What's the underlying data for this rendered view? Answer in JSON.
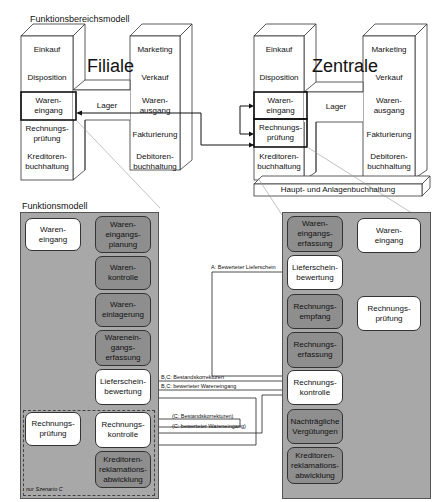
{
  "top_title": "Funktionsbereichsmodell",
  "filiale": {
    "title": "Filiale",
    "left_column": [
      "Einkauf",
      "Disposition",
      "Waren-\neingang",
      "Rechnungs-\nprüfung",
      "Kreditoren-\nbuchhaltung"
    ],
    "middle": "Lager",
    "right_column": [
      "Marketing",
      "Verkauf",
      "Waren-\nausgang",
      "Fakturierung",
      "Debitoren-\nbuchhaltung"
    ],
    "highlighted": [
      "Waren-\neingang"
    ]
  },
  "zentrale": {
    "title": "Zentrale",
    "left_column": [
      "Einkauf",
      "Disposition",
      "Waren-\neingang",
      "Rechnungs-\nprüfung",
      "Kreditoren-\nbuchhaltung"
    ],
    "middle": "Lager",
    "right_column": [
      "Marketing",
      "Verkauf",
      "Waren-\nausgang",
      "Fakturierung",
      "Debitoren-\nbuchhaltung"
    ],
    "base": "Haupt- und Anlagenbuchhaltung",
    "highlighted": [
      "Waren-\neingang",
      "Rechnungs-\nprüfung"
    ]
  },
  "functional_title": "Funktionsmodell",
  "left_panel": {
    "parent_nodes": [
      {
        "label": "Waren-\neingang",
        "style": "white"
      },
      {
        "label": "Rechnungs-\nprüfung",
        "style": "white"
      }
    ],
    "child_nodes": [
      {
        "label": "Waren-\neingangs-\nplanung",
        "style": "grey"
      },
      {
        "label": "Waren-\nkontrolle",
        "style": "grey"
      },
      {
        "label": "Waren-\neinlagerung",
        "style": "grey"
      },
      {
        "label": "Warenein-\ngangs-\nerfassung",
        "style": "grey"
      },
      {
        "label": "Lieferschein-\nbewertung",
        "style": "white"
      },
      {
        "label": "Rechnungs-\nkontrolle",
        "style": "white"
      },
      {
        "label": "Kreditoren-\nreklamations-\nabwicklung",
        "style": "grey"
      }
    ],
    "scenario_note": "nur Szenario C"
  },
  "right_panel": {
    "parent_nodes": [
      {
        "label": "Waren-\neingang",
        "style": "white"
      },
      {
        "label": "Rechnungs-\nprüfung",
        "style": "white"
      }
    ],
    "child_nodes": [
      {
        "label": "Waren-\neingangs-\nerfassung",
        "style": "grey"
      },
      {
        "label": "Lieferschein-\nbewertung",
        "style": "white"
      },
      {
        "label": "Rechnungs-\nempfang",
        "style": "grey"
      },
      {
        "label": "Rechnungs-\nerfassung",
        "style": "grey"
      },
      {
        "label": "Rechnungs-\nkontrolle",
        "style": "white"
      },
      {
        "label": "Nachträgliche\nVergütungen",
        "style": "grey"
      },
      {
        "label": "Kreditoren-\nreklamations-\nabwicklung",
        "style": "grey"
      }
    ]
  },
  "flows": [
    "A: Bewerteter Lieferschein",
    "B,C: Bestandskorrekturen",
    "B,C: bewerteter Wareneingang",
    "(C: Bestandskorrekturen)",
    "(C: bewerteter Wareneingang)"
  ],
  "colors": {
    "panel_bg": "#a8a8a8",
    "grey_node": "#8e8e8e",
    "white_node": "#ffffff",
    "line": "#222222"
  }
}
